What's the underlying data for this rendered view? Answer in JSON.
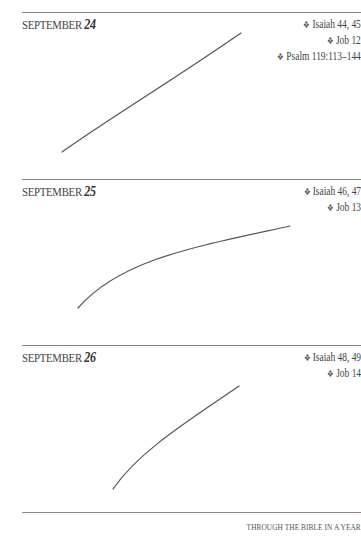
{
  "entries": [
    {
      "month": "SEPTEMBER",
      "day": "24",
      "readings": [
        "Isaiah 44, 45",
        "Job 12",
        "Psalm 119:113–144"
      ]
    },
    {
      "month": "SEPTEMBER",
      "day": "25",
      "readings": [
        "Isaiah 46, 47",
        "Job 13"
      ]
    },
    {
      "month": "SEPTEMBER",
      "day": "26",
      "readings": [
        "Isaiah 48, 49",
        "Job 14"
      ]
    }
  ],
  "bullet_icon": "❖",
  "footer": {
    "title": "THROUGH THE BIBLE IN A YEAR"
  },
  "colors": {
    "rule": "#8a8a8a",
    "text": "#3a3a3a",
    "stroke": "#555555"
  }
}
